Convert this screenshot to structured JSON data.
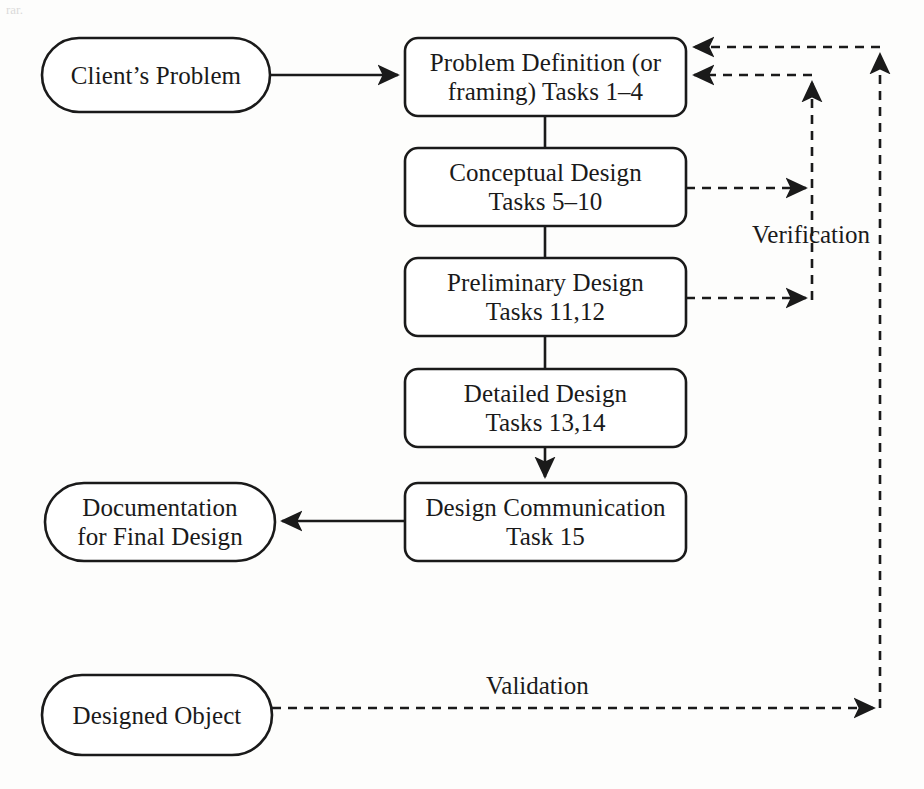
{
  "figure": {
    "type": "flowchart",
    "background_color": "#fdfdfc",
    "stroke_color": "#1a1a1a",
    "text_color": "#1a1a1a"
  },
  "nodes": [
    {
      "id": "clients-problem",
      "shape": "stadium",
      "lines": [
        "Client’s Problem"
      ],
      "x": 42,
      "y": 38,
      "w": 228,
      "h": 74
    },
    {
      "id": "problem-definition",
      "shape": "rounded-rect",
      "lines": [
        "Problem Definition (or",
        "framing) Tasks 1–4"
      ],
      "x": 405,
      "y": 38,
      "w": 281,
      "h": 78
    },
    {
      "id": "conceptual-design",
      "shape": "rounded-rect",
      "lines": [
        "Conceptual Design",
        "Tasks 5–10"
      ],
      "x": 405,
      "y": 148,
      "w": 281,
      "h": 78
    },
    {
      "id": "preliminary-design",
      "shape": "rounded-rect",
      "lines": [
        "Preliminary Design",
        "Tasks 11,12"
      ],
      "x": 405,
      "y": 258,
      "w": 281,
      "h": 78
    },
    {
      "id": "detailed-design",
      "shape": "rounded-rect",
      "lines": [
        "Detailed Design",
        "Tasks 13,14"
      ],
      "x": 405,
      "y": 369,
      "w": 281,
      "h": 78
    },
    {
      "id": "design-communication",
      "shape": "rounded-rect",
      "lines": [
        "Design Communication",
        "Task 15"
      ],
      "x": 405,
      "y": 483,
      "w": 281,
      "h": 78
    },
    {
      "id": "documentation",
      "shape": "stadium",
      "lines": [
        "Documentation",
        "for Final Design"
      ],
      "x": 45,
      "y": 483,
      "w": 230,
      "h": 78
    },
    {
      "id": "designed-object",
      "shape": "stadium",
      "lines": [
        "Designed Object"
      ],
      "x": 42,
      "y": 675,
      "w": 230,
      "h": 80
    }
  ],
  "edges": [
    {
      "id": "clients-problem-to-problem-definition",
      "style": "solid",
      "arrow": "end"
    },
    {
      "id": "problem-definition-to-conceptual-design",
      "style": "solid",
      "arrow": "none"
    },
    {
      "id": "conceptual-design-to-preliminary-design",
      "style": "solid",
      "arrow": "none"
    },
    {
      "id": "preliminary-design-to-detailed-design",
      "style": "solid",
      "arrow": "none"
    },
    {
      "id": "detailed-design-to-design-communication",
      "style": "solid",
      "arrow": "end"
    },
    {
      "id": "design-communication-to-documentation",
      "style": "solid",
      "arrow": "end"
    },
    {
      "id": "conceptual-design-verification-feedback",
      "style": "dashed",
      "arrow": "end"
    },
    {
      "id": "preliminary-design-verification-feedback",
      "style": "dashed",
      "arrow": "end"
    },
    {
      "id": "verification-return-to-problem-definition",
      "style": "dashed",
      "arrow": "end"
    },
    {
      "id": "designed-object-validation",
      "style": "dashed",
      "arrow": "end"
    },
    {
      "id": "validation-return-to-problem-definition",
      "style": "dashed",
      "arrow": "end"
    }
  ],
  "edge_labels": [
    {
      "id": "verification-label",
      "text": "Verification",
      "x": 752,
      "y": 222
    },
    {
      "id": "validation-label",
      "text": "Validation",
      "x": 486,
      "y": 673
    }
  ],
  "artifacts": [
    {
      "id": "scan-smudge-top-left",
      "text": "rar.",
      "x": 6,
      "y": 2
    }
  ]
}
